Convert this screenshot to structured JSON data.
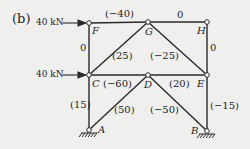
{
  "figure": {
    "part_label": "(b)",
    "colors": {
      "line": "#2a2a2a",
      "background": "#efefed",
      "node_fill": "#ffffff"
    },
    "nodes": {
      "F": {
        "label": "F",
        "x": 89,
        "y": 23
      },
      "G": {
        "label": "G",
        "x": 148,
        "y": 22
      },
      "H": {
        "label": "H",
        "x": 207,
        "y": 22
      },
      "C": {
        "label": "C",
        "x": 89,
        "y": 75
      },
      "D": {
        "label": "D",
        "x": 148,
        "y": 75
      },
      "E": {
        "label": "E",
        "x": 207,
        "y": 75
      },
      "A": {
        "label": "A",
        "x": 89,
        "y": 130
      },
      "B": {
        "label": "B",
        "x": 207,
        "y": 131
      }
    },
    "loads": [
      {
        "label": "40 kN",
        "node": "F",
        "direction": "right"
      },
      {
        "label": "40 kN",
        "node": "C",
        "direction": "right"
      }
    ],
    "members": [
      {
        "from": "F",
        "to": "G",
        "force": "(−40)"
      },
      {
        "from": "G",
        "to": "H",
        "force": "0"
      },
      {
        "from": "F",
        "to": "C",
        "force": "0"
      },
      {
        "from": "C",
        "to": "G",
        "force": "(25)"
      },
      {
        "from": "G",
        "to": "E",
        "force": "(−25)"
      },
      {
        "from": "H",
        "to": "E",
        "force": "0"
      },
      {
        "from": "C",
        "to": "D",
        "force": "(−60)"
      },
      {
        "from": "D",
        "to": "E",
        "force": "(20)"
      },
      {
        "from": "C",
        "to": "A",
        "force": "(15)"
      },
      {
        "from": "A",
        "to": "D",
        "force": "(50)"
      },
      {
        "from": "D",
        "to": "B",
        "force": "(−50)"
      },
      {
        "from": "E",
        "to": "B",
        "force": "(−15)"
      }
    ],
    "supports": [
      {
        "node": "A",
        "type": "pinned"
      },
      {
        "node": "B",
        "type": "pinned"
      }
    ]
  }
}
